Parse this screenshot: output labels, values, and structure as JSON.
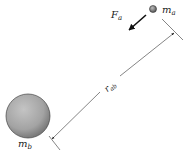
{
  "diagram": {
    "type": "gravitation-two-body",
    "mass_a": {
      "symbol": "m",
      "subscript": "a"
    },
    "mass_b": {
      "symbol": "m",
      "subscript": "b"
    },
    "force": {
      "symbol": "F",
      "subscript": "a"
    },
    "distance": {
      "symbol": "r",
      "subscript": "ab"
    }
  },
  "colors": {
    "line": "#222222",
    "sphere_fill": "#a9a9a9",
    "sphere_dark": "#6e6e6e",
    "background": "#ffffff"
  }
}
